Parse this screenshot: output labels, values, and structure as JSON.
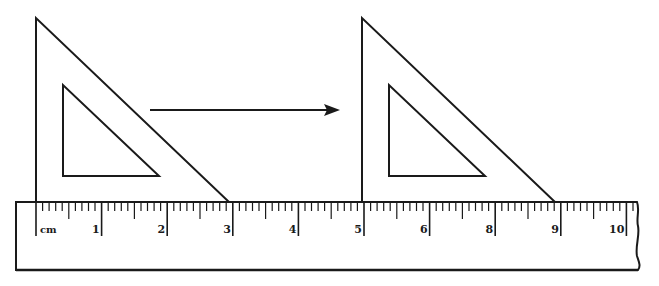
{
  "diagram": {
    "colors": {
      "stroke": "#1a1a1a",
      "background": "#ffffff"
    },
    "ruler": {
      "unit_label": "cm",
      "labels": [
        "1",
        "2",
        "3",
        "4",
        "5",
        "6",
        "8",
        "9",
        "10"
      ],
      "label_positions_cm": [
        1,
        2,
        3,
        4,
        5,
        6,
        7,
        8,
        9,
        10
      ],
      "origin_x": 36,
      "px_per_cm": 65.6,
      "top_y": 202,
      "bottom_y": 270,
      "left_x": 16,
      "right_x": 638
    },
    "triangles": [
      {
        "name": "original",
        "start_cm": 0,
        "end_cm": 3
      },
      {
        "name": "translated",
        "start_cm": 5,
        "end_cm": 8
      }
    ],
    "arrow": {
      "direction": "right",
      "from_x": 150,
      "to_x": 340,
      "y": 110
    }
  }
}
